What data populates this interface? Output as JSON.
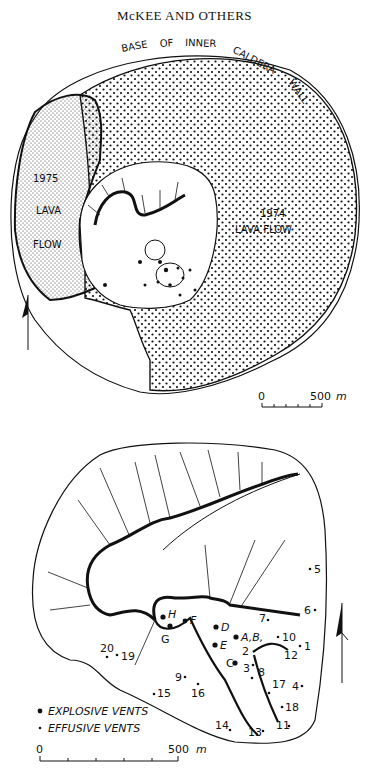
{
  "header": {
    "running_head": "McKEE AND OTHERS"
  },
  "map_top": {
    "caldera_label": "BASE OF INNER CALDERA WALL",
    "caldera_words": [
      "BASE",
      "OF",
      "INNER",
      "CALDERA",
      "WALL"
    ],
    "flow_1975": {
      "year": "1975",
      "line1": "LAVA",
      "line2": "FLOW"
    },
    "flow_1974": {
      "year": "1974",
      "line1": "LAVA FLOW"
    },
    "scale": {
      "start": "0",
      "end": "500",
      "unit": "m"
    },
    "north_arrow": "north-arrow"
  },
  "map_bottom": {
    "explosive_vents": [
      "A,B,",
      "C",
      "D",
      "E",
      "F",
      "G",
      "H"
    ],
    "effusive_vents": [
      "1",
      "2",
      "3",
      "4",
      "5",
      "6",
      "7",
      "8",
      "9",
      "10",
      "11",
      "12",
      "13",
      "14",
      "15",
      "16",
      "17",
      "18",
      "19",
      "20"
    ],
    "legend": {
      "explosive": "EXPLOSIVE VENTS",
      "effusive": "EFFUSIVE VENTS"
    },
    "scale": {
      "start": "0",
      "end": "500",
      "unit": "m"
    },
    "north_arrow": "north-arrow"
  },
  "colors": {
    "ink": "#111111",
    "paper": "#ffffff"
  }
}
